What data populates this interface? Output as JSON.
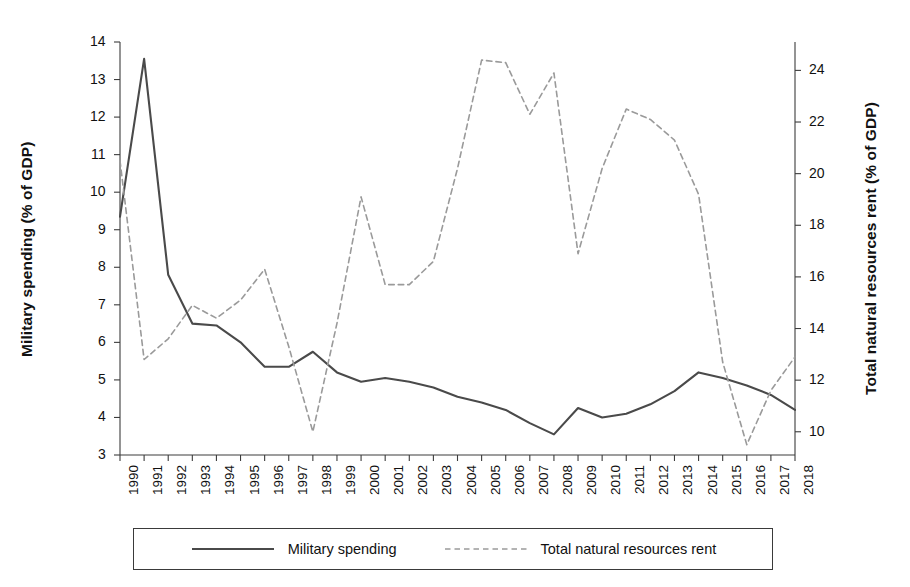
{
  "chart_data": {
    "type": "line",
    "title": "",
    "xlabel": "",
    "ylabel": "Military spending (% of GDP)",
    "y2label": "Total natural resources rent (% of GDP)",
    "grid": false,
    "legend_position": "bottom",
    "x": [
      1990,
      1991,
      1992,
      1993,
      1994,
      1995,
      1996,
      1997,
      1998,
      1999,
      2000,
      2001,
      2002,
      2003,
      2004,
      2005,
      2006,
      2007,
      2008,
      2009,
      2010,
      2011,
      2012,
      2013,
      2014,
      2015,
      2016,
      2017,
      2018
    ],
    "categories": [
      "1990",
      "1991",
      "1992",
      "1993",
      "1994",
      "1995",
      "1996",
      "1997",
      "1998",
      "1999",
      "2000",
      "2001",
      "2002",
      "2003",
      "2004",
      "2005",
      "2006",
      "2007",
      "2008",
      "2009",
      "2010",
      "2011",
      "2012",
      "2013",
      "2014",
      "2015",
      "2016",
      "2017",
      "2018"
    ],
    "xlim": [
      1990,
      2018
    ],
    "ylim": [
      3,
      14
    ],
    "yticks": [
      3,
      4,
      5,
      6,
      7,
      8,
      9,
      10,
      11,
      12,
      13,
      14
    ],
    "ytick_labels": [
      "3",
      "4",
      "5",
      "6",
      "7",
      "8",
      "9",
      "10",
      "11",
      "12",
      "13",
      "14"
    ],
    "y2lim": [
      9.1,
      25.1
    ],
    "y2ticks": [
      10,
      12,
      14,
      16,
      18,
      20,
      22,
      24
    ],
    "y2tick_labels": [
      "10",
      "12",
      "14",
      "16",
      "18",
      "20",
      "22",
      "24"
    ],
    "series": [
      {
        "name": "Military spending",
        "axis": "left",
        "style": "solid",
        "color": "#4a4a4a",
        "width": 2.1,
        "values": [
          9.35,
          13.55,
          7.8,
          6.5,
          6.45,
          6.0,
          5.35,
          5.35,
          5.75,
          5.2,
          4.95,
          5.05,
          4.95,
          4.8,
          4.55,
          4.4,
          4.2,
          3.85,
          3.55,
          4.25,
          4.0,
          4.1,
          4.35,
          4.7,
          5.2,
          5.05,
          4.85,
          4.6,
          4.2
        ]
      },
      {
        "name": "Total natural resources rent",
        "axis": "right",
        "style": "dashed",
        "color": "#9a9a9a",
        "width": 1.6,
        "values": [
          20.5,
          12.8,
          13.6,
          14.9,
          14.4,
          15.1,
          16.3,
          13.3,
          10.0,
          14.2,
          19.1,
          15.7,
          15.7,
          16.6,
          20.2,
          24.4,
          24.3,
          22.3,
          23.9,
          16.9,
          20.2,
          22.5,
          22.1,
          21.3,
          19.2,
          12.7,
          9.5,
          11.6,
          12.9
        ]
      }
    ],
    "legend": [
      {
        "label": "Military spending",
        "style": "solid",
        "color": "#4a4a4a"
      },
      {
        "label": "Total natural resources rent",
        "style": "dashed",
        "color": "#9a9a9a"
      }
    ]
  },
  "layout": {
    "plot_left": 120,
    "plot_right": 795,
    "plot_top": 42,
    "plot_bottom": 455
  }
}
